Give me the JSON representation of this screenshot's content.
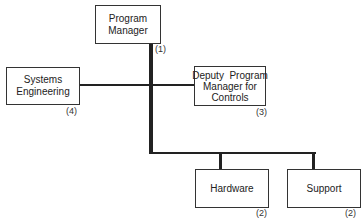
{
  "diagram": {
    "type": "organization-chart",
    "nodes": [
      {
        "id": "pm",
        "label": "Program Manager",
        "line1": "Program",
        "line2": "Manager",
        "number": "(1)"
      },
      {
        "id": "se",
        "label": "Systems Engineering",
        "line1": "Systems",
        "line2": "Engineering",
        "number": "(4)"
      },
      {
        "id": "dpm",
        "label": "Deputy Program Manager for Controls",
        "line1": "Deputy  Program",
        "line2": "Manager for",
        "line3": "Controls",
        "number": "(3)"
      },
      {
        "id": "hw",
        "label": "Hardware",
        "number": "(2)"
      },
      {
        "id": "sup",
        "label": "Support",
        "number": "(2)"
      }
    ],
    "edges": [
      {
        "from": "pm",
        "to": "se",
        "style": "thin"
      },
      {
        "from": "pm",
        "to": "dpm",
        "style": "thin"
      },
      {
        "from": "pm",
        "to": "hw",
        "style": "thick"
      },
      {
        "from": "pm",
        "to": "sup",
        "style": "thick"
      }
    ]
  }
}
